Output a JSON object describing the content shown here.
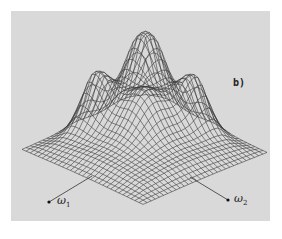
{
  "figure": {
    "panel_label": "b)",
    "axes": {
      "x_symbol": "ω",
      "x_subscript": "1",
      "y_symbol": "ω",
      "y_subscript": "2"
    },
    "plot_type": "3d wireframe surface",
    "colors": {
      "background": "#d9d9d9",
      "mesh": "#3a3a3a",
      "page": "#ffffff"
    }
  }
}
